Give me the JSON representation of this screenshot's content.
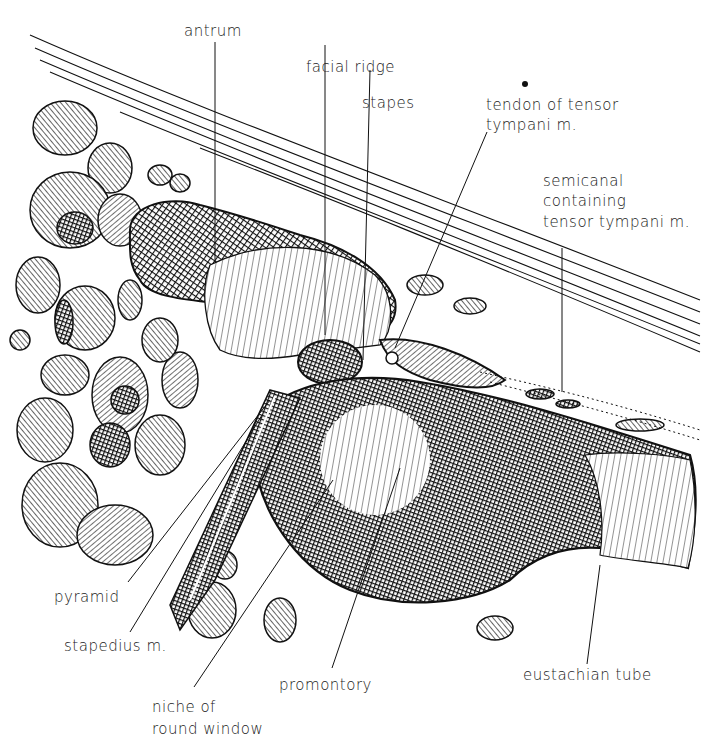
{
  "figure": {
    "colors": {
      "ink": "#111111",
      "paper": "#ffffff"
    }
  },
  "labels": {
    "antrum": "antrum",
    "facial_ridge": "facial ridge",
    "stapes": "stapes",
    "tendon_line1": "tendon of tensor",
    "tendon_line2": "tympani m.",
    "semicanal_line1": "semicanal",
    "semicanal_line2": "containing",
    "semicanal_line3": "tensor tympani m.",
    "pyramid": "pyramid",
    "stapedius": "stapedius m.",
    "niche_line1": "niche of",
    "niche_line2": "round window",
    "promontory": "promontory",
    "eustachian_tube": "eustachian tube"
  }
}
